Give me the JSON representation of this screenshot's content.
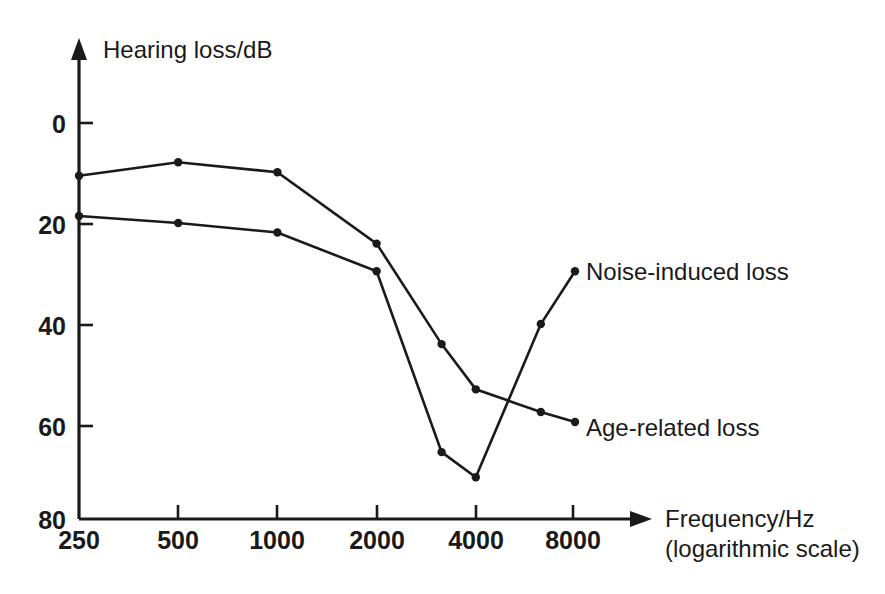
{
  "chart_data": {
    "type": "line",
    "title": "",
    "xlabel": "Frequency/Hz",
    "xlabel_sub": "(logarithmic scale)",
    "ylabel": "Hearing loss/dB",
    "x_scale": "logarithmic",
    "x_tick_labels": [
      "250",
      "500",
      "1000",
      "2000",
      "4000",
      "8000"
    ],
    "x_tick_values": [
      250,
      500,
      1000,
      2000,
      4000,
      8000
    ],
    "y_tick_labels": [
      "0",
      "20",
      "40",
      "60",
      "80"
    ],
    "y_tick_values": [
      0,
      20,
      40,
      60,
      80
    ],
    "ylim": [
      0,
      80
    ],
    "y_inverted": true,
    "xlim": [
      250,
      8000
    ],
    "grid": false,
    "legend_position": "inline-right",
    "series": [
      {
        "name": "Age-related loss",
        "label": "Age-related loss",
        "x": [
          250,
          500,
          1000,
          2000,
          3150,
          4000,
          6300,
          8000
        ],
        "values": [
          10.5,
          7.8,
          9.8,
          24.0,
          44.0,
          53.0,
          57.5,
          59.5
        ]
      },
      {
        "name": "Noise-induced loss",
        "label": "Noise-induced loss",
        "x": [
          250,
          500,
          1000,
          2000,
          3150,
          4000,
          6300,
          8000
        ],
        "values": [
          18.5,
          19.9,
          21.8,
          29.5,
          65.5,
          70.5,
          40.0,
          29.5
        ]
      }
    ]
  },
  "labels": {
    "y_axis_title": "Hearing loss/dB",
    "x_axis_title": "Frequency/Hz",
    "x_axis_subtitle": "(logarithmic scale)",
    "series_noise": "Noise-induced loss",
    "series_age": "Age-related loss"
  },
  "ticks": {
    "y": [
      "0",
      "20",
      "40",
      "60",
      "80"
    ],
    "x": [
      "250",
      "500",
      "1000",
      "2000",
      "4000",
      "8000"
    ]
  },
  "colors": {
    "ink": "#1a1a1a",
    "background": "#ffffff"
  }
}
